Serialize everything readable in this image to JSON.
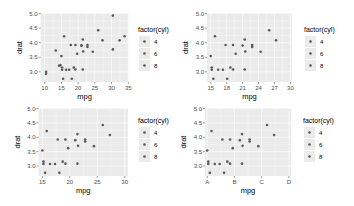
{
  "chart_data": [
    {
      "type": "scatter",
      "panel": "top-left",
      "title": "",
      "xlabel": "mpg",
      "ylabel": "drat",
      "xlim": [
        8.8,
        35.1
      ],
      "ylim": [
        2.65,
        5.02
      ],
      "x_ticks": [
        "10",
        "15",
        "20",
        "25",
        "30",
        "35"
      ],
      "x_tick_values": [
        10,
        15,
        20,
        25,
        30,
        35
      ],
      "y_ticks": [
        "3.0",
        "3.5",
        "4.0",
        "4.5",
        "5.0"
      ],
      "y_tick_values": [
        3.0,
        3.5,
        4.0,
        4.5,
        5.0
      ],
      "grid": true,
      "legend": {
        "title": "factor(cyl)",
        "entries": [
          "4",
          "6",
          "8"
        ],
        "position": "right"
      },
      "points": [
        {
          "x": 21.0,
          "y": 3.9,
          "cyl": "6"
        },
        {
          "x": 21.0,
          "y": 3.9,
          "cyl": "6"
        },
        {
          "x": 22.8,
          "y": 3.85,
          "cyl": "4"
        },
        {
          "x": 21.4,
          "y": 3.08,
          "cyl": "6"
        },
        {
          "x": 18.7,
          "y": 3.15,
          "cyl": "8"
        },
        {
          "x": 18.1,
          "y": 2.76,
          "cyl": "6"
        },
        {
          "x": 14.3,
          "y": 3.21,
          "cyl": "8"
        },
        {
          "x": 24.4,
          "y": 3.69,
          "cyl": "4"
        },
        {
          "x": 22.8,
          "y": 3.92,
          "cyl": "4"
        },
        {
          "x": 19.2,
          "y": 3.92,
          "cyl": "6"
        },
        {
          "x": 17.8,
          "y": 3.92,
          "cyl": "6"
        },
        {
          "x": 16.4,
          "y": 3.07,
          "cyl": "8"
        },
        {
          "x": 17.3,
          "y": 3.07,
          "cyl": "8"
        },
        {
          "x": 15.2,
          "y": 3.07,
          "cyl": "8"
        },
        {
          "x": 10.4,
          "y": 2.93,
          "cyl": "8"
        },
        {
          "x": 10.4,
          "y": 3.0,
          "cyl": "8"
        },
        {
          "x": 14.7,
          "y": 3.23,
          "cyl": "8"
        },
        {
          "x": 32.4,
          "y": 4.08,
          "cyl": "4"
        },
        {
          "x": 30.4,
          "y": 4.93,
          "cyl": "4"
        },
        {
          "x": 33.9,
          "y": 4.22,
          "cyl": "4"
        },
        {
          "x": 21.5,
          "y": 3.7,
          "cyl": "4"
        },
        {
          "x": 15.5,
          "y": 2.76,
          "cyl": "8"
        },
        {
          "x": 15.2,
          "y": 3.15,
          "cyl": "8"
        },
        {
          "x": 13.3,
          "y": 3.73,
          "cyl": "8"
        },
        {
          "x": 19.2,
          "y": 3.08,
          "cyl": "8"
        },
        {
          "x": 27.3,
          "y": 4.08,
          "cyl": "4"
        },
        {
          "x": 26.0,
          "y": 4.43,
          "cyl": "4"
        },
        {
          "x": 30.4,
          "y": 3.77,
          "cyl": "4"
        },
        {
          "x": 15.8,
          "y": 4.22,
          "cyl": "8"
        },
        {
          "x": 19.7,
          "y": 3.62,
          "cyl": "6"
        },
        {
          "x": 15.0,
          "y": 3.54,
          "cyl": "8"
        },
        {
          "x": 21.4,
          "y": 4.11,
          "cyl": "4"
        }
      ]
    },
    {
      "type": "scatter",
      "panel": "top-right",
      "title": "",
      "xlabel": "mpg",
      "ylabel": "drat",
      "xlim": [
        14.3,
        30.3
      ],
      "ylim": [
        2.65,
        5.02
      ],
      "x_ticks": [
        "15",
        "18",
        "21",
        "24",
        "27",
        "30"
      ],
      "x_tick_values": [
        15,
        18,
        21,
        24,
        27,
        30
      ],
      "y_ticks": [
        "3.0",
        "3.5",
        "4.0",
        "4.5",
        "5.0"
      ],
      "y_tick_values": [
        3.0,
        3.5,
        4.0,
        4.5,
        5.0
      ],
      "grid": true,
      "legend": {
        "title": "factor(cyl)",
        "entries": [
          "4",
          "6",
          "8"
        ],
        "position": "right"
      },
      "points": [
        {
          "x": 21.0,
          "y": 3.9,
          "cyl": "6"
        },
        {
          "x": 22.8,
          "y": 3.85,
          "cyl": "4"
        },
        {
          "x": 21.4,
          "y": 3.08,
          "cyl": "6"
        },
        {
          "x": 18.7,
          "y": 3.15,
          "cyl": "8"
        },
        {
          "x": 18.1,
          "y": 2.76,
          "cyl": "6"
        },
        {
          "x": 24.4,
          "y": 3.69,
          "cyl": "4"
        },
        {
          "x": 22.8,
          "y": 3.92,
          "cyl": "4"
        },
        {
          "x": 19.2,
          "y": 3.92,
          "cyl": "6"
        },
        {
          "x": 17.8,
          "y": 3.92,
          "cyl": "6"
        },
        {
          "x": 16.4,
          "y": 3.07,
          "cyl": "8"
        },
        {
          "x": 17.3,
          "y": 3.07,
          "cyl": "8"
        },
        {
          "x": 15.2,
          "y": 3.07,
          "cyl": "8"
        },
        {
          "x": 15.2,
          "y": 3.15,
          "cyl": "8"
        },
        {
          "x": 15.5,
          "y": 2.76,
          "cyl": "8"
        },
        {
          "x": 19.2,
          "y": 3.08,
          "cyl": "8"
        },
        {
          "x": 27.3,
          "y": 4.08,
          "cyl": "4"
        },
        {
          "x": 26.0,
          "y": 4.43,
          "cyl": "4"
        },
        {
          "x": 15.8,
          "y": 4.22,
          "cyl": "8"
        },
        {
          "x": 19.7,
          "y": 3.62,
          "cyl": "6"
        },
        {
          "x": 15.0,
          "y": 3.54,
          "cyl": "8"
        },
        {
          "x": 21.4,
          "y": 4.11,
          "cyl": "4"
        },
        {
          "x": 21.5,
          "y": 3.7,
          "cyl": "4"
        }
      ]
    },
    {
      "type": "scatter",
      "panel": "bottom-left",
      "title": "",
      "xlabel": "mpg",
      "ylabel": "drat",
      "xlim": [
        14.3,
        30.6
      ],
      "ylim": [
        2.65,
        5.02
      ],
      "x_ticks": [
        "15",
        "20",
        "25",
        "30"
      ],
      "x_tick_values": [
        15,
        20,
        25,
        30
      ],
      "y_ticks": [
        "3.0",
        "3.5",
        "4.0",
        "4.5",
        "5.0"
      ],
      "y_tick_values": [
        3.0,
        3.5,
        4.0,
        4.5,
        5.0
      ],
      "grid": true,
      "legend": {
        "title": "factor(cyl)",
        "entries": [
          "4",
          "6",
          "8"
        ],
        "position": "right"
      },
      "points": [
        {
          "x": 21.0,
          "y": 3.9,
          "cyl": "6"
        },
        {
          "x": 22.8,
          "y": 3.85,
          "cyl": "4"
        },
        {
          "x": 21.4,
          "y": 3.08,
          "cyl": "6"
        },
        {
          "x": 18.7,
          "y": 3.15,
          "cyl": "8"
        },
        {
          "x": 18.1,
          "y": 2.76,
          "cyl": "6"
        },
        {
          "x": 24.4,
          "y": 3.69,
          "cyl": "4"
        },
        {
          "x": 22.8,
          "y": 3.92,
          "cyl": "4"
        },
        {
          "x": 19.2,
          "y": 3.92,
          "cyl": "6"
        },
        {
          "x": 17.8,
          "y": 3.92,
          "cyl": "6"
        },
        {
          "x": 16.4,
          "y": 3.07,
          "cyl": "8"
        },
        {
          "x": 17.3,
          "y": 3.07,
          "cyl": "8"
        },
        {
          "x": 15.2,
          "y": 3.07,
          "cyl": "8"
        },
        {
          "x": 15.2,
          "y": 3.15,
          "cyl": "8"
        },
        {
          "x": 15.5,
          "y": 2.76,
          "cyl": "8"
        },
        {
          "x": 19.2,
          "y": 3.08,
          "cyl": "8"
        },
        {
          "x": 27.3,
          "y": 4.08,
          "cyl": "4"
        },
        {
          "x": 26.0,
          "y": 4.43,
          "cyl": "4"
        },
        {
          "x": 15.8,
          "y": 4.22,
          "cyl": "8"
        },
        {
          "x": 19.7,
          "y": 3.62,
          "cyl": "6"
        },
        {
          "x": 15.0,
          "y": 3.54,
          "cyl": "8"
        },
        {
          "x": 21.4,
          "y": 4.11,
          "cyl": "4"
        },
        {
          "x": 21.5,
          "y": 3.7,
          "cyl": "4"
        }
      ]
    },
    {
      "type": "scatter",
      "panel": "bottom-right",
      "title": "",
      "xlabel": "mpg",
      "ylabel": "drat",
      "xlim": [
        14.6,
        30.4
      ],
      "ylim": [
        2.65,
        5.02
      ],
      "x_ticks": [
        "A",
        "B",
        "C",
        "D"
      ],
      "x_tick_values": [
        15,
        20,
        25,
        30
      ],
      "y_ticks": [
        "3.0",
        "3.5",
        "4.0",
        "4.5",
        "5.0"
      ],
      "y_tick_values": [
        3.0,
        3.5,
        4.0,
        4.5,
        5.0
      ],
      "grid": true,
      "legend": {
        "title": "factor(cyl)",
        "entries": [
          "4",
          "6",
          "8"
        ],
        "position": "right"
      },
      "points": [
        {
          "x": 21.0,
          "y": 3.9,
          "cyl": "6"
        },
        {
          "x": 22.8,
          "y": 3.85,
          "cyl": "4"
        },
        {
          "x": 21.4,
          "y": 3.08,
          "cyl": "6"
        },
        {
          "x": 18.7,
          "y": 3.15,
          "cyl": "8"
        },
        {
          "x": 18.1,
          "y": 2.76,
          "cyl": "6"
        },
        {
          "x": 24.4,
          "y": 3.69,
          "cyl": "4"
        },
        {
          "x": 22.8,
          "y": 3.92,
          "cyl": "4"
        },
        {
          "x": 19.2,
          "y": 3.92,
          "cyl": "6"
        },
        {
          "x": 17.8,
          "y": 3.92,
          "cyl": "6"
        },
        {
          "x": 16.4,
          "y": 3.07,
          "cyl": "8"
        },
        {
          "x": 17.3,
          "y": 3.07,
          "cyl": "8"
        },
        {
          "x": 15.2,
          "y": 3.07,
          "cyl": "8"
        },
        {
          "x": 15.2,
          "y": 3.15,
          "cyl": "8"
        },
        {
          "x": 15.5,
          "y": 2.76,
          "cyl": "8"
        },
        {
          "x": 19.2,
          "y": 3.08,
          "cyl": "8"
        },
        {
          "x": 27.3,
          "y": 4.08,
          "cyl": "4"
        },
        {
          "x": 26.0,
          "y": 4.43,
          "cyl": "4"
        },
        {
          "x": 15.8,
          "y": 4.22,
          "cyl": "8"
        },
        {
          "x": 19.7,
          "y": 3.62,
          "cyl": "6"
        },
        {
          "x": 15.0,
          "y": 3.54,
          "cyl": "8"
        },
        {
          "x": 21.4,
          "y": 4.11,
          "cyl": "4"
        },
        {
          "x": 21.5,
          "y": 3.7,
          "cyl": "4"
        }
      ]
    }
  ],
  "colors": {
    "panel_bg": "#ebebeb",
    "grid": "#ffffff",
    "point": "#595959",
    "tick_text": "#4d4d4d",
    "legend_key_bg": "#ebebeb"
  },
  "layout": [
    {
      "px": [
        40.7,
        128.6
      ],
      "py": [
        13,
        82
      ],
      "legend": {
        "x": 140,
        "y": 25
      }
    },
    {
      "px": [
        207,
        292
      ],
      "py": [
        13,
        82
      ],
      "legend": {
        "x": 306,
        "y": 25
      }
    },
    {
      "px": [
        38.5,
        128
      ],
      "py": [
        108,
        176
      ],
      "legend": {
        "x": 140,
        "y": 116
      }
    },
    {
      "px": [
        205,
        291
      ],
      "py": [
        108,
        176
      ],
      "legend": {
        "x": 305,
        "y": 116
      }
    }
  ]
}
